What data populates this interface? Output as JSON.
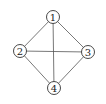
{
  "diagram": {
    "type": "graph",
    "nodes": [
      {
        "id": "1",
        "label": "1",
        "x": 53,
        "y": 17
      },
      {
        "id": "2",
        "label": "2",
        "x": 20,
        "y": 51
      },
      {
        "id": "3",
        "label": "3",
        "x": 88,
        "y": 52
      },
      {
        "id": "4",
        "label": "4",
        "x": 54,
        "y": 88
      }
    ],
    "edges": [
      [
        "1",
        "2"
      ],
      [
        "1",
        "3"
      ],
      [
        "1",
        "4"
      ],
      [
        "2",
        "3"
      ],
      [
        "2",
        "4"
      ],
      [
        "3",
        "4"
      ]
    ],
    "node_radius": 6.5,
    "colors": {
      "edge": "#555555",
      "node_stroke": "#333333",
      "label": "#222222"
    }
  }
}
